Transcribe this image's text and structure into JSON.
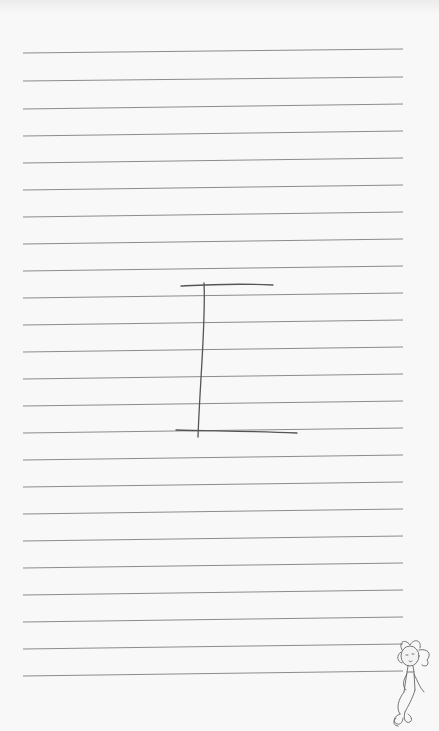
{
  "page": {
    "background": "#f8f8f8",
    "line_color": "#7f7f7f",
    "ink_color": "#555555",
    "ruled_lines": [
      {
        "y1": 53,
        "y2": 49
      },
      {
        "y1": 81,
        "y2": 77
      },
      {
        "y1": 109,
        "y2": 104
      },
      {
        "y1": 136,
        "y2": 131
      },
      {
        "y1": 163,
        "y2": 158
      },
      {
        "y1": 190,
        "y2": 185
      },
      {
        "y1": 217,
        "y2": 212
      },
      {
        "y1": 244,
        "y2": 239
      },
      {
        "y1": 271,
        "y2": 266
      },
      {
        "y1": 298,
        "y2": 293
      },
      {
        "y1": 325,
        "y2": 320
      },
      {
        "y1": 352,
        "y2": 347
      },
      {
        "y1": 379,
        "y2": 374
      },
      {
        "y1": 406,
        "y2": 401
      },
      {
        "y1": 433,
        "y2": 428
      },
      {
        "y1": 460,
        "y2": 455
      },
      {
        "y1": 487,
        "y2": 482
      },
      {
        "y1": 514,
        "y2": 509
      },
      {
        "y1": 541,
        "y2": 536
      },
      {
        "y1": 568,
        "y2": 563
      },
      {
        "y1": 595,
        "y2": 590
      },
      {
        "y1": 622,
        "y2": 617
      },
      {
        "y1": 649,
        "y2": 644
      },
      {
        "y1": 676,
        "y2": 671
      }
    ],
    "line_x_start": 23,
    "line_x_end": 403
  },
  "drawing": {
    "letter": "I",
    "top_bar": "M181,286 C200,285 230,283 273,285",
    "stem": "M204,283 C206,320 200,380 198,437",
    "bottom_bar": "M176,430 C210,431 250,431 297,433"
  },
  "mascot": {
    "name": "cartoon-girl",
    "x": 398,
    "y": 642
  }
}
